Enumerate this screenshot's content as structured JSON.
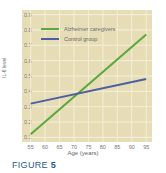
{
  "figure": {
    "prefix": "FIGURE",
    "number": "5"
  },
  "colors": {
    "plot_bg": "#e6ddb6",
    "grid": "#f4efd8",
    "alzheimer": "#5aa83c",
    "control": "#4a5fa0",
    "figure_label": "#1f5a8a"
  },
  "chart_data": {
    "type": "line",
    "title": "",
    "xlabel": "Age (years)",
    "ylabel": "IL-6 level",
    "x": [
      55,
      95
    ],
    "xticks": [
      55,
      60,
      65,
      70,
      75,
      80,
      85,
      90,
      95
    ],
    "yticks": [
      0.1,
      0.2,
      0.3,
      0.4,
      0.5,
      0.6,
      0.7,
      0.8,
      0.9
    ],
    "xlim": [
      52,
      97
    ],
    "ylim": [
      0.07,
      0.93
    ],
    "grid": true,
    "legend_position": "upper left",
    "series": [
      {
        "name": "Alzheimer caregivers",
        "x": [
          55,
          95
        ],
        "values": [
          0.12,
          0.77
        ],
        "color": "#5aa83c"
      },
      {
        "name": "Control group",
        "x": [
          55,
          95
        ],
        "values": [
          0.32,
          0.48
        ],
        "color": "#4a5fa0"
      }
    ]
  }
}
